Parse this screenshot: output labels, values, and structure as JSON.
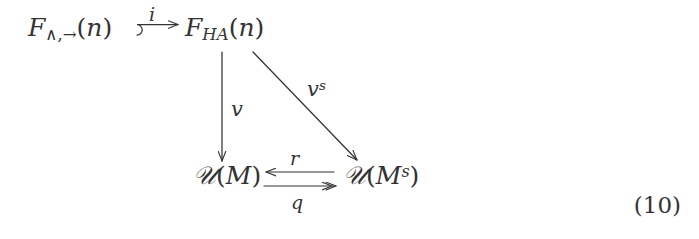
{
  "diagram": {
    "type": "commutative-diagram",
    "equation_number": "(10)",
    "background_color": "#ffffff",
    "ink_color": "#333333",
    "nodes": [
      {
        "id": "source",
        "label": "F_{\\wedge,\\to}(n)",
        "base": "F",
        "subscript": "∧,→",
        "suffix": "(n)",
        "position": "top-left"
      },
      {
        "id": "middle",
        "label": "F_{HA}(n)",
        "base": "F",
        "subscript": "HA",
        "suffix": "(n)",
        "position": "top-right"
      },
      {
        "id": "um",
        "label": "U(M)",
        "base": "𝒰",
        "argument": "M",
        "position": "bottom-left"
      },
      {
        "id": "ums",
        "label": "U(M^s)",
        "base": "𝒰",
        "argument": "M",
        "argument_superscript": "s",
        "position": "bottom-right"
      }
    ],
    "arrows": [
      {
        "id": "i",
        "label": "i",
        "from": "source",
        "to": "middle",
        "style": "hooked",
        "direction": "right",
        "label_position": "above"
      },
      {
        "id": "v",
        "label": "v",
        "from": "middle",
        "to": "um",
        "style": "plain",
        "direction": "down",
        "label_position": "right"
      },
      {
        "id": "vs",
        "label": "v",
        "label_superscript": "s",
        "from": "middle",
        "to": "ums",
        "style": "plain",
        "direction": "diagonal-down-right",
        "label_position": "right"
      },
      {
        "id": "r",
        "label": "r",
        "from": "ums",
        "to": "um",
        "style": "plain",
        "direction": "left",
        "label_position": "above"
      },
      {
        "id": "q",
        "label": "q",
        "from": "um",
        "to": "ums",
        "style": "double-head",
        "direction": "right",
        "label_position": "below"
      }
    ]
  },
  "symbols": {
    "F": "F",
    "wedge": "∧",
    "comma": ",",
    "to_arrow": "→",
    "open_paren": "(",
    "close_paren": ")",
    "n": "n",
    "HA": "HA",
    "script_U": "𝒰",
    "M": "M",
    "s": "s",
    "i": "i",
    "v": "v",
    "r": "r",
    "q": "q"
  }
}
